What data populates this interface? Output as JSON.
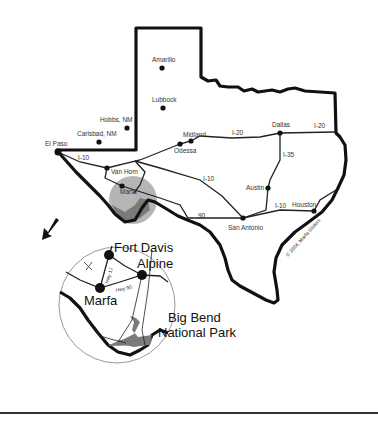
{
  "map": {
    "title": "Texas region map highlighting Marfa and Big Bend",
    "cities": [
      {
        "name": "Amarillo",
        "x": 162,
        "y": 68,
        "lx": 152,
        "ly": 62
      },
      {
        "name": "Lubbock",
        "x": 163,
        "y": 108,
        "lx": 152,
        "ly": 102
      },
      {
        "name": "Hobbs, NM",
        "x": 127,
        "y": 128,
        "lx": 100,
        "ly": 122
      },
      {
        "name": "Carlsbad, NM",
        "x": 99,
        "y": 142,
        "lx": 77,
        "ly": 136
      },
      {
        "name": "El Paso",
        "x": 58,
        "y": 152,
        "lx": 45,
        "ly": 146
      },
      {
        "name": "Midland",
        "x": 191,
        "y": 141,
        "lx": 183,
        "ly": 137
      },
      {
        "name": "Odessa",
        "x": 180,
        "y": 144,
        "lx": 174,
        "ly": 153
      },
      {
        "name": "Dallas",
        "x": 280,
        "y": 133,
        "lx": 272,
        "ly": 127
      },
      {
        "name": "Van Horn",
        "x": 107,
        "y": 168,
        "lx": 111,
        "ly": 174
      },
      {
        "name": "Marfa",
        "x": 122,
        "y": 186,
        "lx": 120,
        "ly": 194
      },
      {
        "name": "Austin",
        "x": 268,
        "y": 188,
        "lx": 246,
        "ly": 190
      },
      {
        "name": "San Antonio",
        "x": 243,
        "y": 218,
        "lx": 228,
        "ly": 230
      },
      {
        "name": "Houston",
        "x": 314,
        "y": 211,
        "lx": 292,
        "ly": 207
      }
    ],
    "highway_labels": [
      {
        "text": "I-20",
        "x": 232,
        "y": 135
      },
      {
        "text": "I-20",
        "x": 314,
        "y": 128
      },
      {
        "text": "I-35",
        "x": 283,
        "y": 157
      },
      {
        "text": "I-10",
        "x": 78,
        "y": 160
      },
      {
        "text": "I-10",
        "x": 203,
        "y": 181
      },
      {
        "text": "I-10",
        "x": 275,
        "y": 208
      },
      {
        "text": "90",
        "x": 198,
        "y": 218
      }
    ],
    "copyright": "© 2004, Marfa Gliders",
    "inset": {
      "cities": [
        {
          "name": "Fort Davis",
          "x": 109,
          "y": 255,
          "lx": 114,
          "ly": 252
        },
        {
          "name": "Alpine",
          "x": 142,
          "y": 275,
          "lx": 137,
          "ly": 268
        },
        {
          "name": "Marfa",
          "x": 100,
          "y": 288,
          "lx": 84,
          "ly": 305
        }
      ],
      "roads": [
        {
          "text": "Hwy 17",
          "x": 108,
          "y": 280
        },
        {
          "text": "Hwy 90",
          "x": 118,
          "y": 291
        }
      ],
      "park_label_line1": "Big Bend",
      "park_label_line2": "National Park"
    }
  },
  "colors": {
    "border": "#111111",
    "road": "#222222",
    "highlight_circle": "#b0b0b0",
    "park_fill": "#7a7a7a",
    "inset_circle_stroke": "#999999"
  }
}
